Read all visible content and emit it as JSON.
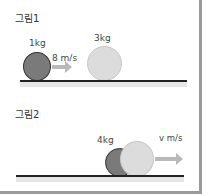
{
  "figure1": {
    "title": "그림1",
    "small_ball_mass": "1kg",
    "small_ball_velocity": "8 m/s",
    "large_ball_mass": "3kg"
  },
  "figure2": {
    "title": "그림2",
    "combined_mass": "4kg",
    "combined_velocity": "v m/s"
  },
  "colors": {
    "dark_ball": "#7a7a7a",
    "light_ball": "#dcdcdc",
    "arrow": "#b9b9b9",
    "ground": "#222222",
    "frame": "#9a9a9a"
  }
}
